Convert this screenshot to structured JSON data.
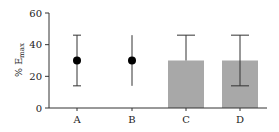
{
  "chart_data": {
    "type": "bar",
    "title": "",
    "xlabel": "",
    "ylabel": "% E",
    "ylabel_subscript": "max",
    "ylim": [
      0,
      60
    ],
    "yticks": [
      0,
      20,
      40,
      60
    ],
    "ytick_labels": [
      "0",
      "20",
      "40",
      "60"
    ],
    "grid": false,
    "legend": null,
    "categories": [
      "A",
      "B",
      "C",
      "D"
    ],
    "series": [
      {
        "name": "values",
        "values": [
          30,
          30,
          30,
          30
        ],
        "styles": [
          "point",
          "point",
          "bar",
          "bar"
        ],
        "error_upper": [
          46,
          46,
          46,
          46
        ],
        "error_lower": [
          14,
          14,
          null,
          14
        ],
        "error_caps": [
          true,
          false,
          true,
          true
        ]
      }
    ],
    "colors": {
      "bar_fill": "#a8a8a8",
      "point_fill": "#000000",
      "axis": "#333333",
      "errorbar": "#333333"
    }
  }
}
